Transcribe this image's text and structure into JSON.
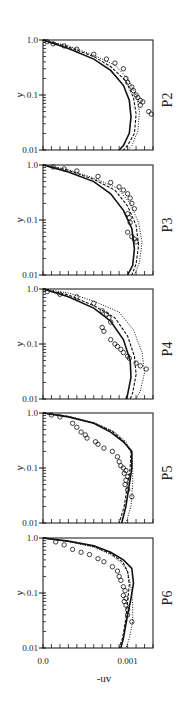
{
  "chart_data": {
    "type": "line",
    "layout": "5 stacked panels sharing x axis",
    "xlabel": "-uv",
    "ylabel": "y",
    "xlim": [
      0.0,
      0.0013
    ],
    "ylim": [
      0.01,
      1.0
    ],
    "yscale": "log",
    "x_tick_labels": [
      "0.0",
      "0.001"
    ],
    "y_tick_labels": [
      "0.01",
      "0.1",
      "1.0"
    ],
    "grid": false,
    "legend": null,
    "series_styles": [
      {
        "name": "model-solid",
        "style": "solid"
      },
      {
        "name": "model-dashed",
        "style": "dashed"
      },
      {
        "name": "model-dotted",
        "style": "dotted"
      },
      {
        "name": "experiment",
        "style": "open-circle markers"
      }
    ],
    "panels": [
      {
        "label": "P2",
        "solid": [
          [
            0.0,
            1.0
          ],
          [
            0.0003,
            0.7
          ],
          [
            0.0006,
            0.45
          ],
          [
            0.0008,
            0.28
          ],
          [
            0.00095,
            0.15
          ],
          [
            0.00102,
            0.08
          ],
          [
            0.00104,
            0.04
          ],
          [
            0.00102,
            0.02
          ],
          [
            0.00095,
            0.012
          ],
          [
            0.0009,
            0.01
          ]
        ],
        "dashed": [
          [
            0.0,
            1.0
          ],
          [
            0.0003,
            0.75
          ],
          [
            0.0006,
            0.5
          ],
          [
            0.0008,
            0.33
          ],
          [
            0.00098,
            0.18
          ],
          [
            0.00107,
            0.09
          ],
          [
            0.0011,
            0.045
          ],
          [
            0.00108,
            0.02
          ],
          [
            0.001,
            0.012
          ],
          [
            0.00095,
            0.01
          ]
        ],
        "dotted": [
          [
            0.0,
            1.0
          ],
          [
            0.0003,
            0.78
          ],
          [
            0.0006,
            0.53
          ],
          [
            0.00085,
            0.35
          ],
          [
            0.001,
            0.2
          ],
          [
            0.0011,
            0.1
          ],
          [
            0.00114,
            0.05
          ],
          [
            0.00112,
            0.022
          ],
          [
            0.00105,
            0.012
          ],
          [
            0.001,
            0.01
          ]
        ],
        "points": [
          [
            5e-05,
            0.93
          ],
          [
            0.00012,
            0.85
          ],
          [
            0.00025,
            0.78
          ],
          [
            0.0004,
            0.68
          ],
          [
            0.0006,
            0.55
          ],
          [
            0.00075,
            0.45
          ],
          [
            0.00085,
            0.38
          ],
          [
            0.00095,
            0.3
          ],
          [
            0.00098,
            0.2
          ],
          [
            0.001,
            0.17
          ],
          [
            0.00105,
            0.14
          ],
          [
            0.00107,
            0.12
          ],
          [
            0.0011,
            0.1
          ],
          [
            0.00112,
            0.09
          ],
          [
            0.00115,
            0.08
          ],
          [
            0.00118,
            0.075
          ],
          [
            0.00115,
            0.065
          ],
          [
            0.00125,
            0.05
          ],
          [
            0.00128,
            0.045
          ]
        ]
      },
      {
        "label": "P3",
        "solid": [
          [
            0.0,
            1.0
          ],
          [
            0.0003,
            0.75
          ],
          [
            0.0006,
            0.5
          ],
          [
            0.0008,
            0.3
          ],
          [
            0.00095,
            0.15
          ],
          [
            0.00105,
            0.07
          ],
          [
            0.00108,
            0.03
          ],
          [
            0.00106,
            0.015
          ],
          [
            0.001,
            0.01
          ]
        ],
        "dashed": [
          [
            0.0,
            1.0
          ],
          [
            0.0003,
            0.8
          ],
          [
            0.0006,
            0.55
          ],
          [
            0.00085,
            0.35
          ],
          [
            0.001,
            0.18
          ],
          [
            0.0011,
            0.08
          ],
          [
            0.00113,
            0.035
          ],
          [
            0.0011,
            0.016
          ],
          [
            0.00105,
            0.01
          ]
        ],
        "dotted": [
          [
            0.0,
            1.0
          ],
          [
            0.0003,
            0.82
          ],
          [
            0.0006,
            0.58
          ],
          [
            0.00088,
            0.38
          ],
          [
            0.00103,
            0.2
          ],
          [
            0.00113,
            0.09
          ],
          [
            0.00117,
            0.04
          ],
          [
            0.00114,
            0.017
          ],
          [
            0.00108,
            0.01
          ]
        ],
        "points": [
          [
            0.00012,
            0.92
          ],
          [
            0.00025,
            0.85
          ],
          [
            0.0004,
            0.78
          ],
          [
            0.00065,
            0.62
          ],
          [
            0.0008,
            0.48
          ],
          [
            0.0009,
            0.4
          ],
          [
            0.00095,
            0.35
          ],
          [
            0.001,
            0.3
          ],
          [
            0.00103,
            0.25
          ],
          [
            0.00105,
            0.2
          ],
          [
            0.00108,
            0.16
          ],
          [
            0.001,
            0.13
          ],
          [
            0.00102,
            0.11
          ],
          [
            0.00103,
            0.09
          ],
          [
            0.001,
            0.06
          ],
          [
            0.00105,
            0.05
          ],
          [
            0.00108,
            0.045
          ],
          [
            0.0011,
            0.04
          ]
        ]
      },
      {
        "label": "P4",
        "solid": [
          [
            0.0,
            1.0
          ],
          [
            0.0003,
            0.72
          ],
          [
            0.0006,
            0.45
          ],
          [
            0.0008,
            0.26
          ],
          [
            0.00095,
            0.12
          ],
          [
            0.00103,
            0.05
          ],
          [
            0.00104,
            0.025
          ],
          [
            0.001,
            0.012
          ],
          [
            0.00098,
            0.01
          ]
        ],
        "dashed": [
          [
            0.0,
            1.0
          ],
          [
            0.0003,
            0.78
          ],
          [
            0.0006,
            0.5
          ],
          [
            0.00085,
            0.3
          ],
          [
            0.001,
            0.14
          ],
          [
            0.00108,
            0.06
          ],
          [
            0.0011,
            0.028
          ],
          [
            0.00106,
            0.013
          ],
          [
            0.00103,
            0.01
          ]
        ],
        "dotted": [
          [
            0.0,
            1.0
          ],
          [
            0.0003,
            0.85
          ],
          [
            0.0006,
            0.6
          ],
          [
            0.0009,
            0.38
          ],
          [
            0.00107,
            0.18
          ],
          [
            0.00117,
            0.07
          ],
          [
            0.0012,
            0.03
          ],
          [
            0.00115,
            0.014
          ],
          [
            0.0011,
            0.01
          ]
        ],
        "points": [
          [
            5e-05,
            0.9
          ],
          [
            0.0002,
            0.8
          ],
          [
            0.0004,
            0.72
          ],
          [
            0.0006,
            0.55
          ],
          [
            0.0007,
            0.4
          ],
          [
            0.00075,
            0.35
          ],
          [
            0.00078,
            0.3
          ],
          [
            0.0008,
            0.25
          ],
          [
            0.0007,
            0.2
          ],
          [
            0.00072,
            0.17
          ],
          [
            0.0008,
            0.12
          ],
          [
            0.00085,
            0.1
          ],
          [
            0.00088,
            0.09
          ],
          [
            0.00092,
            0.08
          ],
          [
            0.00095,
            0.07
          ],
          [
            0.001,
            0.06
          ],
          [
            0.00102,
            0.055
          ],
          [
            0.0011,
            0.045
          ],
          [
            0.00115,
            0.04
          ],
          [
            0.00122,
            0.035
          ]
        ]
      },
      {
        "label": "P5",
        "solid": [
          [
            0.0,
            1.0
          ],
          [
            0.0003,
            0.85
          ],
          [
            0.0006,
            0.65
          ],
          [
            0.0008,
            0.45
          ],
          [
            0.00095,
            0.3
          ],
          [
            0.00105,
            0.2
          ],
          [
            0.00105,
            0.1
          ],
          [
            0.00102,
            0.05
          ],
          [
            0.00098,
            0.02
          ],
          [
            0.00093,
            0.01
          ]
        ],
        "dashed": [
          [
            0.0,
            1.0
          ],
          [
            0.0003,
            0.86
          ],
          [
            0.0006,
            0.66
          ],
          [
            0.00082,
            0.46
          ],
          [
            0.00096,
            0.3
          ],
          [
            0.00104,
            0.2
          ],
          [
            0.00103,
            0.1
          ],
          [
            0.001,
            0.05
          ],
          [
            0.00096,
            0.02
          ],
          [
            0.0009,
            0.01
          ]
        ],
        "dotted": [
          [
            0.0,
            1.0
          ],
          [
            0.0003,
            0.87
          ],
          [
            0.0006,
            0.67
          ],
          [
            0.00083,
            0.47
          ],
          [
            0.00097,
            0.31
          ],
          [
            0.00105,
            0.2
          ],
          [
            0.00106,
            0.1
          ],
          [
            0.00106,
            0.05
          ],
          [
            0.00104,
            0.02
          ],
          [
            0.00098,
            0.01
          ]
        ],
        "points": [
          [
            0.0001,
            0.92
          ],
          [
            0.0002,
            0.85
          ],
          [
            0.00035,
            0.65
          ],
          [
            0.0004,
            0.55
          ],
          [
            0.00045,
            0.45
          ],
          [
            0.0005,
            0.4
          ],
          [
            0.00052,
            0.35
          ],
          [
            0.00062,
            0.3
          ],
          [
            0.00065,
            0.27
          ],
          [
            0.00072,
            0.23
          ],
          [
            0.00082,
            0.2
          ],
          [
            0.00088,
            0.16
          ],
          [
            0.0009,
            0.13
          ],
          [
            0.00092,
            0.11
          ],
          [
            0.00095,
            0.1
          ],
          [
            0.00098,
            0.09
          ],
          [
            0.00096,
            0.08
          ],
          [
            0.001,
            0.07
          ],
          [
            0.00098,
            0.06
          ],
          [
            0.00097,
            0.05
          ],
          [
            0.001,
            0.04
          ],
          [
            0.00105,
            0.03
          ]
        ]
      },
      {
        "label": "P6",
        "solid": [
          [
            0.0,
            1.0
          ],
          [
            0.0003,
            0.88
          ],
          [
            0.0006,
            0.72
          ],
          [
            0.0008,
            0.55
          ],
          [
            0.00095,
            0.4
          ],
          [
            0.00105,
            0.28
          ],
          [
            0.00107,
            0.15
          ],
          [
            0.00104,
            0.08
          ],
          [
            0.001,
            0.04
          ],
          [
            0.00095,
            0.015
          ],
          [
            0.00092,
            0.01
          ]
        ],
        "dashed": [
          [
            0.0,
            1.0
          ],
          [
            0.0003,
            0.87
          ],
          [
            0.0006,
            0.7
          ],
          [
            0.0008,
            0.52
          ],
          [
            0.00094,
            0.37
          ],
          [
            0.001,
            0.25
          ],
          [
            0.00102,
            0.14
          ],
          [
            0.001,
            0.07
          ],
          [
            0.00098,
            0.035
          ],
          [
            0.00094,
            0.015
          ],
          [
            0.0009,
            0.01
          ]
        ],
        "dotted": [
          [
            0.0,
            1.0
          ],
          [
            0.0003,
            0.86
          ],
          [
            0.0006,
            0.68
          ],
          [
            0.0008,
            0.5
          ],
          [
            0.00093,
            0.35
          ],
          [
            0.001,
            0.24
          ],
          [
            0.00104,
            0.13
          ],
          [
            0.00106,
            0.06
          ],
          [
            0.00106,
            0.03
          ],
          [
            0.00102,
            0.015
          ],
          [
            0.00098,
            0.01
          ]
        ],
        "points": [
          [
            0.00015,
            0.85
          ],
          [
            0.00025,
            0.75
          ],
          [
            0.00035,
            0.62
          ],
          [
            0.00045,
            0.55
          ],
          [
            0.00055,
            0.5
          ],
          [
            0.00065,
            0.42
          ],
          [
            0.00072,
            0.37
          ],
          [
            0.00082,
            0.3
          ],
          [
            0.00088,
            0.25
          ],
          [
            0.0009,
            0.2
          ],
          [
            0.00092,
            0.17
          ],
          [
            0.00095,
            0.13
          ],
          [
            0.00097,
            0.11
          ],
          [
            0.00095,
            0.09
          ],
          [
            0.00098,
            0.08
          ],
          [
            0.00096,
            0.07
          ],
          [
            0.00098,
            0.06
          ],
          [
            0.001,
            0.05
          ],
          [
            0.001,
            0.04
          ],
          [
            0.00105,
            0.03
          ]
        ]
      }
    ]
  }
}
